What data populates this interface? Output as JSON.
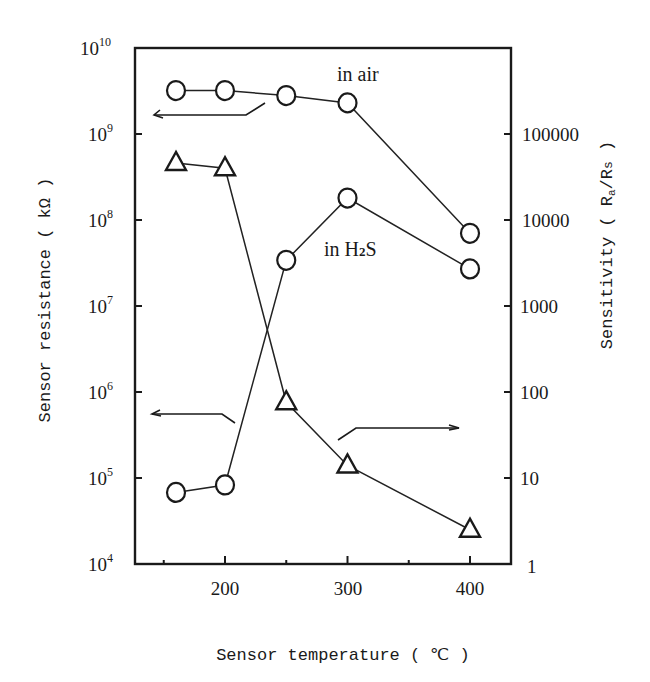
{
  "chart_data": {
    "type": "line",
    "title": "",
    "xlabel": "Sensor temperature ( ℃ )",
    "ylabel_left": "Sensor resistance ( kΩ )",
    "ylabel_right": "Sensitivity ( Ra / Rs )",
    "x_ticks": [
      200,
      300,
      400
    ],
    "x_minor_ticks": [
      150,
      250,
      350
    ],
    "xlim": [
      127,
      434
    ],
    "y_left_scale": "log",
    "y_left_ticks": [
      "10^4",
      "10^5",
      "10^6",
      "10^7",
      "10^8",
      "10^9",
      "10^10"
    ],
    "y_left_lim": [
      10000,
      10000000000
    ],
    "y_right_scale": "log",
    "y_right_ticks": [
      "1",
      "10",
      "100",
      "1000",
      "10000",
      "100000"
    ],
    "y_right_lim": [
      1,
      1000000
    ],
    "grid": false,
    "series": [
      {
        "name": "in air",
        "axis": "left",
        "marker": "circle",
        "x": [
          160,
          200,
          250,
          300,
          400
        ],
        "values": [
          3200000000,
          3200000000,
          2800000000,
          2300000000,
          70000000
        ]
      },
      {
        "name": "in H2S",
        "axis": "left",
        "marker": "circle",
        "x": [
          160,
          200,
          250,
          300,
          400
        ],
        "values": [
          68000,
          83000,
          34000000,
          180000000,
          27000000
        ]
      },
      {
        "name": "Sensitivity (Ra/Rs)",
        "axis": "right",
        "marker": "triangle",
        "x": [
          160,
          200,
          250,
          300,
          400
        ],
        "values": [
          46000,
          40000,
          76,
          14,
          2.5
        ]
      }
    ],
    "annotations": [
      {
        "text": "in air",
        "near_series": "in air"
      },
      {
        "text": "in H₂S",
        "near_series": "in H2S"
      },
      {
        "text": "←",
        "meaning": "upper circles read on left axis"
      },
      {
        "text": "←",
        "meaning": "lower circles read on left axis"
      },
      {
        "text": "→",
        "meaning": "triangles read on right axis"
      }
    ]
  },
  "labels": {
    "x_title": "Sensor temperature ( ℃ )",
    "y_left_title": "Sensor resistance ( kΩ )",
    "y_right_title": "Sensitivity ( R",
    "y_right_sub_a": "a",
    "y_right_mid": "/R",
    "y_right_sub_s": "s",
    "y_right_close": " )",
    "annot_air": "in air",
    "annot_h2s_pre": "in H",
    "annot_h2s_sub": "2",
    "annot_h2s_post": "S",
    "x_ticks": [
      "200",
      "300",
      "400"
    ],
    "y_left_base": "10",
    "y_left_exps": [
      "10",
      "9",
      "8",
      "7",
      "6",
      "5",
      "4"
    ],
    "y_right_ticks": [
      "100000",
      "10000",
      "1000",
      "100",
      "10",
      "1"
    ]
  }
}
